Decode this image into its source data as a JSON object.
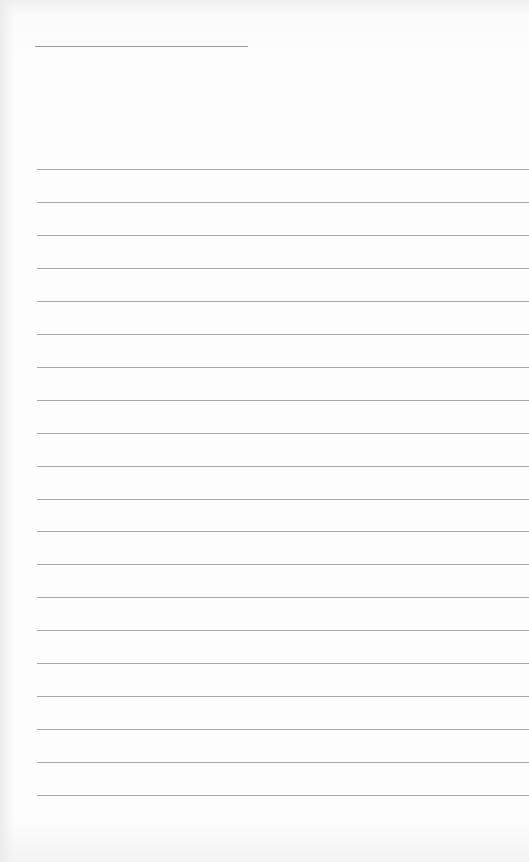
{
  "page": {
    "type": "blank lined paper",
    "title_line": {
      "text": ""
    },
    "ruled_lines_count": 20,
    "lines": [
      "",
      "",
      "",
      "",
      "",
      "",
      "",
      "",
      "",
      "",
      "",
      "",
      "",
      "",
      "",
      "",
      "",
      "",
      "",
      ""
    ]
  },
  "colors": {
    "paper": "#fdfdfd",
    "rule": "#a8a8a8",
    "title_rule": "#9a9a9a"
  }
}
